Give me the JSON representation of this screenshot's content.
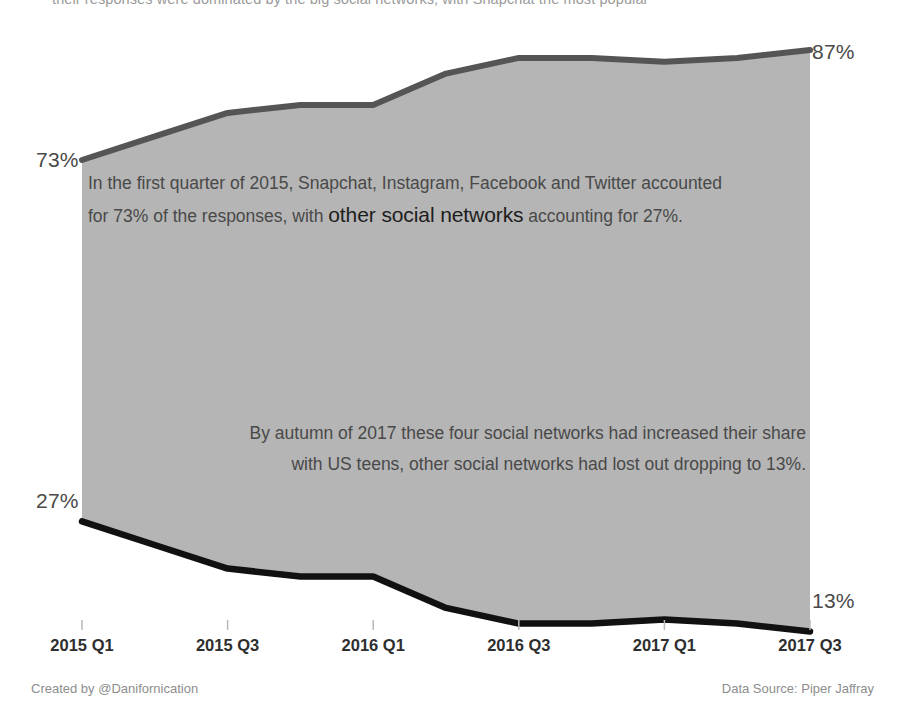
{
  "top_clipped_text": "their responses were dominated by the big social networks, with Snapchat the most popular",
  "chart_data": {
    "type": "area",
    "title": "",
    "subtitle": "",
    "xlabel": "",
    "ylabel": "",
    "ylim": [
      0,
      100
    ],
    "grid": false,
    "legend_position": "none",
    "x": [
      "2015 Q1",
      "2015 Q2",
      "2015 Q3",
      "2015 Q4",
      "2016 Q1",
      "2016 Q2",
      "2016 Q3",
      "2016 Q4",
      "2017 Q1",
      "2017 Q2",
      "2017 Q3"
    ],
    "tick_labels": [
      "2015 Q1",
      "2015 Q3",
      "2016 Q1",
      "2016 Q3",
      "2017 Q1",
      "2017 Q3"
    ],
    "series": [
      {
        "name": "Snapchat, Instagram, Facebook and Twitter",
        "color": "#555555",
        "values": [
          73,
          76,
          79,
          80,
          80,
          84,
          86,
          86,
          85.5,
          86,
          87
        ]
      },
      {
        "name": "Other social networks",
        "color": "#111111",
        "values": [
          27,
          24,
          21,
          20,
          20,
          16,
          14,
          14,
          14.5,
          14,
          13
        ]
      }
    ],
    "fill_color": "#b5b5b5",
    "endpoint_labels": {
      "upper_start": "73%",
      "upper_end": "87%",
      "lower_start": "27%",
      "lower_end": "13%"
    },
    "annotations": [
      {
        "id": "annotation-first-quarter",
        "line1_before": "In the first quarter of 2015, Snapchat, Instagram, Facebook and Twitter accounted",
        "line2_before": "for 73% of the responses, with ",
        "line2_emphasis": "other social networks",
        "line2_after": " accounting for 27%."
      },
      {
        "id": "annotation-autumn-2017",
        "line1": "By autumn of 2017 these four social networks had increased their share",
        "line2": "with US teens, other social networks had lost out dropping to 13%."
      }
    ]
  },
  "footer": {
    "credit": "Created by @Danifornication",
    "source": "Data Source: Piper Jaffray"
  }
}
